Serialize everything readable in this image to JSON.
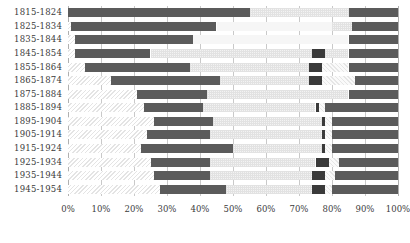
{
  "chart_data": {
    "type": "bar",
    "title": "",
    "xlabel": "",
    "ylabel": "",
    "orientation": "horizontal",
    "stacked": true,
    "grid": true,
    "legend_position": "none",
    "xlim": [
      0,
      100
    ],
    "xtick_labels": [
      "0%",
      "10%",
      "20%",
      "30%",
      "40%",
      "50%",
      "60%",
      "70%",
      "80%",
      "90%",
      "100%"
    ],
    "xtick_values": [
      0,
      10,
      20,
      30,
      40,
      50,
      60,
      70,
      80,
      90,
      100
    ],
    "categories": [
      "1815-1824",
      "1825-1834",
      "1835-1844",
      "1845-1854",
      "1855-1864",
      "1865-1874",
      "1875-1884",
      "1885-1894",
      "1895-1904",
      "1905-1914",
      "1915-1924",
      "1925-1934",
      "1935-1944",
      "1945-1954"
    ],
    "series": [
      {
        "name": "segment-1-hatched-left",
        "values": [
          0,
          1,
          2,
          2,
          5,
          13,
          21,
          23,
          26,
          24,
          22,
          25,
          26,
          28
        ]
      },
      {
        "name": "segment-2-dark",
        "values": [
          55,
          44,
          36,
          23,
          32,
          33,
          21,
          18,
          18,
          19,
          28,
          18,
          17,
          20
        ]
      },
      {
        "name": "segment-3-light-dotted",
        "values": [
          30,
          41,
          47,
          49,
          42,
          36,
          43,
          34,
          33,
          34,
          27,
          32,
          31,
          26
        ]
      },
      {
        "name": "segment-4-dark-marker",
        "values": [
          0,
          0,
          0,
          4,
          4,
          4,
          1,
          1,
          1,
          1,
          1,
          4,
          4,
          4
        ]
      },
      {
        "name": "segment-5-hatched-right",
        "values": [
          0,
          0,
          0,
          7,
          2,
          1,
          1,
          2,
          2,
          2,
          2,
          3,
          3,
          2
        ]
      },
      {
        "name": "segment-6-dark-right",
        "values": [
          15,
          14,
          15,
          15,
          15,
          13,
          13,
          22,
          20,
          20,
          20,
          18,
          19,
          20
        ]
      }
    ]
  },
  "bars": [
    {
      "label": "1815-1824",
      "segments": [
        {
          "style": "dark",
          "start": 0,
          "end": 55
        },
        {
          "style": "lightdot",
          "start": 55,
          "end": 85
        },
        {
          "style": "dark",
          "start": 85,
          "end": 100
        }
      ]
    },
    {
      "label": "1825-1834",
      "segments": [
        {
          "style": "hatch",
          "start": 0,
          "end": 1
        },
        {
          "style": "dark",
          "start": 1,
          "end": 45
        },
        {
          "style": "pale",
          "start": 45,
          "end": 80
        },
        {
          "style": "lightdot",
          "start": 80,
          "end": 86
        },
        {
          "style": "dark",
          "start": 86,
          "end": 100
        }
      ]
    },
    {
      "label": "1835-1844",
      "segments": [
        {
          "style": "hatch",
          "start": 0,
          "end": 2
        },
        {
          "style": "dark",
          "start": 2,
          "end": 38
        },
        {
          "style": "pale",
          "start": 38,
          "end": 85
        },
        {
          "style": "dark",
          "start": 85,
          "end": 100
        }
      ]
    },
    {
      "label": "1845-1854",
      "segments": [
        {
          "style": "hatch",
          "start": 0,
          "end": 2
        },
        {
          "style": "dark",
          "start": 2,
          "end": 25
        },
        {
          "style": "lightdot",
          "start": 25,
          "end": 74
        },
        {
          "style": "dark2",
          "start": 74,
          "end": 78
        },
        {
          "style": "lightdot",
          "start": 78,
          "end": 85
        },
        {
          "style": "dark",
          "start": 85,
          "end": 100
        }
      ]
    },
    {
      "label": "1855-1864",
      "segments": [
        {
          "style": "hatch",
          "start": 0,
          "end": 5
        },
        {
          "style": "dark",
          "start": 5,
          "end": 37
        },
        {
          "style": "lightdot",
          "start": 37,
          "end": 73
        },
        {
          "style": "dark2",
          "start": 73,
          "end": 77
        },
        {
          "style": "hatchr",
          "start": 77,
          "end": 85
        },
        {
          "style": "dark",
          "start": 85,
          "end": 100
        }
      ]
    },
    {
      "label": "1865-1874",
      "segments": [
        {
          "style": "hatch",
          "start": 0,
          "end": 13
        },
        {
          "style": "dark",
          "start": 13,
          "end": 46
        },
        {
          "style": "lightdot",
          "start": 46,
          "end": 73
        },
        {
          "style": "dark2",
          "start": 73,
          "end": 77
        },
        {
          "style": "hatchr",
          "start": 77,
          "end": 87
        },
        {
          "style": "dark",
          "start": 87,
          "end": 100
        }
      ]
    },
    {
      "label": "1875-1884",
      "segments": [
        {
          "style": "hatch",
          "start": 0,
          "end": 21
        },
        {
          "style": "dark",
          "start": 21,
          "end": 42
        },
        {
          "style": "lightdot",
          "start": 42,
          "end": 85
        },
        {
          "style": "dark",
          "start": 85,
          "end": 100
        }
      ]
    },
    {
      "label": "1885-1894",
      "segments": [
        {
          "style": "hatch",
          "start": 0,
          "end": 23
        },
        {
          "style": "dark",
          "start": 23,
          "end": 41
        },
        {
          "style": "lightdot",
          "start": 41,
          "end": 75
        },
        {
          "style": "dark2",
          "start": 75,
          "end": 76
        },
        {
          "style": "hatchr",
          "start": 76,
          "end": 78
        },
        {
          "style": "dark",
          "start": 78,
          "end": 100
        }
      ]
    },
    {
      "label": "1895-1904",
      "segments": [
        {
          "style": "hatch",
          "start": 0,
          "end": 26
        },
        {
          "style": "dark",
          "start": 26,
          "end": 44
        },
        {
          "style": "lightdot",
          "start": 44,
          "end": 77
        },
        {
          "style": "dark2",
          "start": 77,
          "end": 78
        },
        {
          "style": "hatchr",
          "start": 78,
          "end": 80
        },
        {
          "style": "dark",
          "start": 80,
          "end": 100
        }
      ]
    },
    {
      "label": "1905-1914",
      "segments": [
        {
          "style": "hatch",
          "start": 0,
          "end": 24
        },
        {
          "style": "dark",
          "start": 24,
          "end": 43
        },
        {
          "style": "lightdot",
          "start": 43,
          "end": 77
        },
        {
          "style": "dark2",
          "start": 77,
          "end": 78
        },
        {
          "style": "hatchr",
          "start": 78,
          "end": 80
        },
        {
          "style": "dark",
          "start": 80,
          "end": 100
        }
      ]
    },
    {
      "label": "1915-1924",
      "segments": [
        {
          "style": "hatch",
          "start": 0,
          "end": 22
        },
        {
          "style": "dark",
          "start": 22,
          "end": 50
        },
        {
          "style": "lightdot",
          "start": 50,
          "end": 77
        },
        {
          "style": "dark2",
          "start": 77,
          "end": 78
        },
        {
          "style": "hatchr",
          "start": 78,
          "end": 80
        },
        {
          "style": "dark",
          "start": 80,
          "end": 100
        }
      ]
    },
    {
      "label": "1925-1934",
      "segments": [
        {
          "style": "hatch",
          "start": 0,
          "end": 25
        },
        {
          "style": "dark",
          "start": 25,
          "end": 43
        },
        {
          "style": "lightdot",
          "start": 43,
          "end": 75
        },
        {
          "style": "dark2",
          "start": 75,
          "end": 79
        },
        {
          "style": "hatchr",
          "start": 79,
          "end": 82
        },
        {
          "style": "dark",
          "start": 82,
          "end": 100
        }
      ]
    },
    {
      "label": "1935-1944",
      "segments": [
        {
          "style": "hatch",
          "start": 0,
          "end": 26
        },
        {
          "style": "dark",
          "start": 26,
          "end": 43
        },
        {
          "style": "lightdot",
          "start": 43,
          "end": 74
        },
        {
          "style": "dark2",
          "start": 74,
          "end": 78
        },
        {
          "style": "hatchr",
          "start": 78,
          "end": 81
        },
        {
          "style": "dark",
          "start": 81,
          "end": 100
        }
      ]
    },
    {
      "label": "1945-1954",
      "segments": [
        {
          "style": "hatch",
          "start": 0,
          "end": 28
        },
        {
          "style": "dark",
          "start": 28,
          "end": 48
        },
        {
          "style": "lightdot",
          "start": 48,
          "end": 74
        },
        {
          "style": "dark2",
          "start": 74,
          "end": 78
        },
        {
          "style": "hatchr",
          "start": 78,
          "end": 80
        },
        {
          "style": "dark",
          "start": 80,
          "end": 100
        }
      ]
    }
  ],
  "colors": {
    "dark": "#5b5b5b",
    "dark_marker": "#3a3a3a",
    "light_dotted": "#f3f3f3",
    "pale": "#f6f6f6",
    "gridline": "#c9c9c9",
    "text": "#3b3b3b",
    "background": "#ffffff"
  }
}
